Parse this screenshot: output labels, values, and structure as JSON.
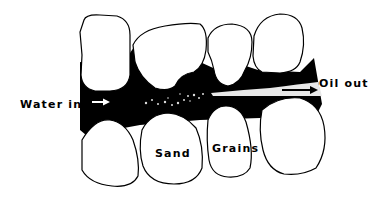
{
  "diagram": {
    "labels": {
      "water_in": "Water in",
      "oil_out": "Oil out",
      "sand": "Sand",
      "grains": "Grains"
    },
    "colors": {
      "pore_fill": "#000000",
      "grain_fill": "#ffffff",
      "oil_stream": "#e8e8e8"
    },
    "icons": {
      "flow_arrow": "right-arrow"
    }
  }
}
